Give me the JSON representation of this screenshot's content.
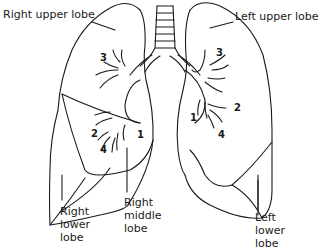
{
  "diagram": {
    "labels": {
      "right_upper_lobe": "Right upper lobe",
      "left_upper_lobe": "Left upper lobe",
      "right_lower_lobe": [
        "Right",
        "lower",
        "lobe"
      ],
      "right_middle_lobe": [
        "Right",
        "middle",
        "lobe"
      ],
      "left_lower_lobe": [
        "Left",
        "lower",
        "lobe"
      ]
    },
    "segment_numbers": {
      "right_upper": "3",
      "right_lower_2": "2",
      "right_lower_4": "4",
      "right_lower_1": "1",
      "left_upper_3": "3",
      "left_2": "2",
      "left_1": "1",
      "left_4": "4"
    },
    "colors": {
      "line": "#1a1a1a",
      "background": "#ffffff"
    }
  }
}
